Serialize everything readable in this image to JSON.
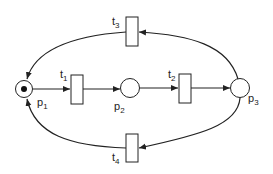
{
  "diagram": {
    "type": "petri-net",
    "places": [
      {
        "id": "p1",
        "label": "p",
        "sub": "1",
        "tokens": 1
      },
      {
        "id": "p2",
        "label": "p",
        "sub": "2",
        "tokens": 0
      },
      {
        "id": "p3",
        "label": "p",
        "sub": "3",
        "tokens": 0
      }
    ],
    "transitions": [
      {
        "id": "t1",
        "label": "t",
        "sub": "1"
      },
      {
        "id": "t2",
        "label": "t",
        "sub": "2"
      },
      {
        "id": "t3",
        "label": "t",
        "sub": "3"
      },
      {
        "id": "t4",
        "label": "t",
        "sub": "4"
      }
    ],
    "arcs": [
      {
        "from": "p1",
        "to": "t1"
      },
      {
        "from": "t1",
        "to": "p2"
      },
      {
        "from": "p2",
        "to": "t2"
      },
      {
        "from": "t2",
        "to": "p3"
      },
      {
        "from": "p3",
        "to": "t3"
      },
      {
        "from": "t3",
        "to": "p1"
      },
      {
        "from": "p3",
        "to": "t4"
      },
      {
        "from": "t4",
        "to": "p1"
      }
    ],
    "colors": {
      "stroke": "#222222",
      "fill": "#ffffff",
      "token": "#111111"
    }
  }
}
